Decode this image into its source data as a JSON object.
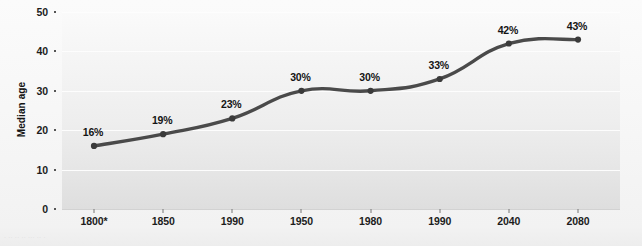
{
  "chart_data": {
    "type": "line",
    "title": "",
    "subtitle": "",
    "xlabel": "",
    "ylabel": "Median age",
    "ylim": [
      0,
      50
    ],
    "y_ticks": [
      0,
      10,
      20,
      30,
      40,
      50
    ],
    "y_tick_labels": [
      "0",
      "10",
      "20",
      "30",
      "40",
      "50"
    ],
    "grid": "horizontal",
    "legend": "none",
    "categories": [
      "1800*",
      "1850",
      "1990",
      "1950",
      "1980",
      "1990",
      "2040",
      "2080"
    ],
    "values": [
      16,
      19,
      23,
      30,
      30,
      33,
      42,
      43
    ],
    "data_labels": [
      "16%",
      "19%",
      "23%",
      "30%",
      "30%",
      "33%",
      "42%",
      "43%"
    ],
    "series": [
      {
        "name": "Median age",
        "values": [
          16,
          19,
          23,
          30,
          30,
          33,
          42,
          43
        ],
        "line_color": "#4a4a4a",
        "marker_color": "#3a3a3a"
      }
    ]
  },
  "axes": {
    "y_title": "Median age",
    "y_tick_labels": [
      "50",
      "40",
      "30",
      "20",
      "10",
      "0"
    ],
    "x_tick_labels": [
      "1800*",
      "1850",
      "1990",
      "1950",
      "1980",
      "1990",
      "2040",
      "2080"
    ]
  },
  "colors": {
    "line": "#4a4a4a",
    "marker": "#3a3a3a",
    "plot_background_top": "#fafafa",
    "plot_background_bottom": "#dedede",
    "gridline": "#fdfdfd",
    "text": "#141414",
    "page_background": "#f7f7f7"
  },
  "footnote": {
    "text": "· ·· ·· ·· ··· ·· ·"
  }
}
